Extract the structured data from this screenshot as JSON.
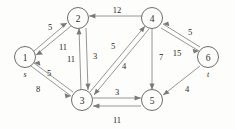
{
  "diagram": {
    "type": "directed-weighted-graph",
    "title": "",
    "nodes": [
      {
        "id": "1",
        "label": "1",
        "terminal_label": "s",
        "x": 25,
        "y": 57
      },
      {
        "id": "2",
        "label": "2",
        "terminal_label": "",
        "x": 78,
        "y": 18
      },
      {
        "id": "3",
        "label": "3",
        "terminal_label": "",
        "x": 82,
        "y": 100
      },
      {
        "id": "4",
        "label": "4",
        "terminal_label": "",
        "x": 152,
        "y": 18
      },
      {
        "id": "5",
        "label": "5",
        "terminal_label": "",
        "x": 152,
        "y": 100
      },
      {
        "id": "6",
        "label": "6",
        "terminal_label": "t",
        "x": 208,
        "y": 57
      }
    ],
    "edges": [
      {
        "from": "1",
        "to": "2",
        "weight": "5",
        "lx": 50,
        "ly": 27
      },
      {
        "from": "2",
        "to": "1",
        "weight": "11",
        "lx": 63,
        "ly": 47
      },
      {
        "from": "1",
        "to": "3",
        "weight": "8",
        "lx": 38,
        "ly": 89
      },
      {
        "from": "3",
        "to": "1",
        "weight": "5",
        "lx": 49,
        "ly": 73
      },
      {
        "from": "3",
        "to": "2",
        "weight": "11",
        "lx": 78,
        "ly": 59
      },
      {
        "from": "2",
        "to": "3",
        "weight": "3",
        "lx": 93,
        "ly": 56
      },
      {
        "from": "4",
        "to": "2",
        "weight": "12",
        "lx": 117,
        "ly": 10
      },
      {
        "from": "3",
        "to": "4",
        "weight": "5",
        "lx": 113,
        "ly": 46
      },
      {
        "from": "4",
        "to": "3",
        "weight": "4",
        "lx": 124,
        "ly": 66
      },
      {
        "from": "4",
        "to": "5",
        "weight": "7",
        "lx": 159,
        "ly": 57
      },
      {
        "from": "4",
        "to": "6",
        "weight": "15",
        "lx": 177,
        "ly": 53
      },
      {
        "from": "6",
        "to": "4",
        "weight": "5",
        "lx": 189,
        "ly": 32
      },
      {
        "from": "6",
        "to": "5",
        "weight": "4",
        "lx": 186,
        "ly": 89
      },
      {
        "from": "3",
        "to": "5",
        "weight": "3",
        "lx": 117,
        "ly": 92
      },
      {
        "from": "5",
        "to": "3",
        "weight": "11",
        "lx": 117,
        "ly": 120
      }
    ]
  },
  "colors": {
    "node_stroke": "#6e6e6e",
    "edge_stroke": "#8a8a8a",
    "text": "#1f1f1f",
    "background": "#fdfdfc"
  }
}
